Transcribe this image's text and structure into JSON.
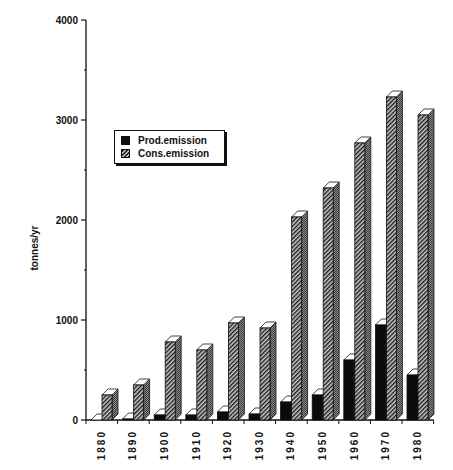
{
  "chart_data": {
    "type": "bar",
    "style": "3d-grouped",
    "title": "",
    "xlabel": "",
    "ylabel": "tonnes/yr",
    "ylim": [
      0,
      4000
    ],
    "yticks": [
      0,
      1000,
      2000,
      3000,
      4000
    ],
    "yminor_ticks": [
      500,
      1500,
      2500,
      3500
    ],
    "grid": false,
    "legend_position": "upper-left inside",
    "categories": [
      "1880",
      "1890",
      "1900",
      "1910",
      "1920",
      "1930",
      "1940",
      "1950",
      "1960",
      "1970",
      "1980"
    ],
    "series": [
      {
        "name": "Prod.emission",
        "fill": "solid-black",
        "values": [
          0,
          10,
          50,
          50,
          80,
          60,
          180,
          250,
          600,
          950,
          450
        ]
      },
      {
        "name": "Cons.emission",
        "fill": "diagonal-hatch",
        "values": [
          250,
          350,
          780,
          700,
          970,
          920,
          2030,
          2320,
          2770,
          3230,
          3050
        ]
      }
    ]
  },
  "legend": {
    "items": [
      {
        "label": "Prod.emission"
      },
      {
        "label": "Cons.emission"
      }
    ]
  },
  "axis": {
    "y_title": "tonnes/yr",
    "y_tick_labels": [
      "0",
      "1000",
      "2000",
      "3000",
      "4000"
    ]
  }
}
